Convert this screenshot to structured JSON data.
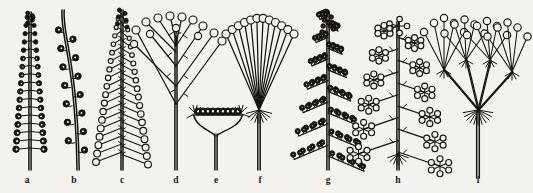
{
  "figure": {
    "background_color": "#f4f2ee",
    "ink_color": "#17140f",
    "width": 533,
    "height": 193,
    "panel_count": 9
  },
  "captions": [
    {
      "key": "a",
      "label": "a",
      "x": 27,
      "y": 175,
      "name": "spike"
    },
    {
      "key": "b",
      "label": "b",
      "x": 74,
      "y": 175,
      "name": "curved-spike"
    },
    {
      "key": "c",
      "label": "c",
      "x": 122,
      "y": 175,
      "name": "raceme"
    },
    {
      "key": "d",
      "label": "d",
      "x": 176,
      "y": 175,
      "name": "panicle-corymb"
    },
    {
      "key": "e",
      "label": "e",
      "x": 216,
      "y": 175,
      "name": "capitulum-head"
    },
    {
      "key": "f",
      "label": "f",
      "x": 260,
      "y": 175,
      "name": "simple-umbel"
    },
    {
      "key": "g",
      "label": "g",
      "x": 328,
      "y": 175,
      "name": "panicle"
    },
    {
      "key": "h",
      "label": "h",
      "x": 398,
      "y": 175,
      "name": "compound-panicle-umbellate"
    },
    {
      "key": "i",
      "label": "i",
      "x": 478,
      "y": 175,
      "name": "compound-umbel"
    }
  ],
  "diagrams": {
    "a": {
      "type": "spike",
      "axis": {
        "x": 30,
        "top": 12,
        "bottom": 170,
        "double_line": true
      },
      "floret_rows": 17,
      "floret_style": "solid-filled-circle",
      "floret_radius": 3.2,
      "row_top_y": 16,
      "row_bottom_y": 148,
      "half_width_top": 3,
      "half_width_bottom": 14,
      "sessile": true
    },
    "b": {
      "type": "curved-spike",
      "axis": {
        "x_top": 62,
        "x_bottom": 77,
        "top": 10,
        "bottom": 170,
        "curved": true,
        "double_line": true
      },
      "floret_count": 14,
      "floret_style": "open-circle-with-hook",
      "floret_radius": 3.4,
      "alternating_sides": true,
      "row_top_y": 30,
      "row_bottom_y": 150
    },
    "c": {
      "type": "raceme",
      "axis": {
        "x": 122,
        "top": 10,
        "bottom": 170,
        "double_line": true
      },
      "floret_rows": 18,
      "floret_style": "open-circle",
      "floret_radius": 3.4,
      "pedicels": true,
      "row_top_y": 14,
      "row_bottom_y": 152,
      "half_width_top": 4,
      "half_width_bottom": 26
    },
    "d": {
      "type": "panicle-corymb",
      "axis": {
        "x": 176,
        "top": 104,
        "bottom": 170,
        "double_line": true
      },
      "branch_levels": 4,
      "floret_count": 13,
      "floret_style": "open-circle",
      "floret_radius": 4.0,
      "top_floret_y": 16,
      "bracts": true,
      "spread_left": 132,
      "spread_right": 222
    },
    "e": {
      "type": "capitulum-head",
      "stalk": {
        "x": 216,
        "top": 134,
        "bottom": 170,
        "double_line": true
      },
      "receptacle_y": 112,
      "receptacle_left": 192,
      "receptacle_right": 244,
      "floret_count": 9,
      "floret_style": "open-circle",
      "floret_radius": 3.6,
      "involucral_bracts": true
    },
    "f": {
      "type": "simple-umbel",
      "axis": {
        "x": 259,
        "top": 112,
        "bottom": 170,
        "double_line": true
      },
      "node_y": 110,
      "ray_count": 12,
      "floret_style": "open-circle",
      "floret_radius": 4.0,
      "top_floret_y": 18,
      "spread_left": 226,
      "spread_right": 294,
      "involucre_tuft": true
    },
    "g": {
      "type": "panicle",
      "axis": {
        "x": 328,
        "top": 12,
        "bottom": 170,
        "double_line": true
      },
      "branch_count": 14,
      "floret_style": "small-open-circle",
      "floret_radius": 2.3,
      "florets_per_branch": 7,
      "row_top_y": 16,
      "row_bottom_y": 156,
      "half_width_top": 8,
      "half_width_bottom": 36
    },
    "h": {
      "type": "compound-panicle-umbellate",
      "axis": {
        "x": 398,
        "top": 22,
        "bottom": 170,
        "double_line": true
      },
      "branch_count": 12,
      "cluster_type": "small-umbel",
      "floret_style": "open-circle",
      "floret_radius": 3.0,
      "florets_per_cluster": 6,
      "row_top_y": 26,
      "row_bottom_y": 152,
      "half_width_top": 14,
      "half_width_bottom": 42,
      "basal_tuft": true
    },
    "i": {
      "type": "compound-umbel",
      "axis": {
        "x": 478,
        "top": 112,
        "bottom": 178,
        "double_line": true
      },
      "primary_node_y": 110,
      "primary_ray_count": 4,
      "secondary_umbel_y": 58,
      "secondary_ray_count": 5,
      "floret_style": "open-circle",
      "floret_radius": 4.0,
      "top_floret_y": 18,
      "spread_left": 430,
      "spread_right": 528,
      "involucre_tuft": true,
      "involucel_tufts": true
    }
  }
}
